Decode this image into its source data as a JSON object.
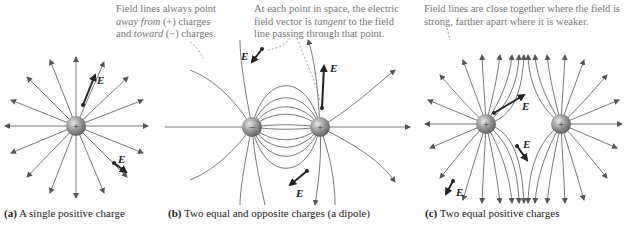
{
  "panels": [
    {
      "id": "a",
      "caption_label": "(a)",
      "caption_text": "A single positive charge",
      "charges": [
        {
          "sign": "+",
          "x": 76,
          "y": 126
        }
      ],
      "vector_labels": [
        "E",
        "E"
      ]
    },
    {
      "id": "b",
      "caption_label": "(b)",
      "caption_text": "Two equal and opposite charges (a dipole)",
      "charges": [
        {
          "sign": "−",
          "x": 252,
          "y": 127
        },
        {
          "sign": "+",
          "x": 320,
          "y": 127
        }
      ],
      "note_left": [
        "Field lines always point",
        "away from (+) charges",
        "and toward (−) charges."
      ],
      "note_right": [
        "At each point in space, the electric",
        "field vector is tangent to the field",
        "line passing through that point."
      ],
      "vector_labels": [
        "E",
        "E",
        "E"
      ]
    },
    {
      "id": "c",
      "caption_label": "(c)",
      "caption_text": "Two equal positive charges",
      "charges": [
        {
          "sign": "+",
          "x": 486,
          "y": 124
        },
        {
          "sign": "+",
          "x": 561,
          "y": 124
        }
      ],
      "note": [
        "Field lines are close together where the field is",
        "strong, farther apart where it is weaker."
      ],
      "vector_labels": [
        "E",
        "E",
        "E"
      ]
    }
  ],
  "colors": {
    "line": "#555555",
    "sphere": "#8a8a8a",
    "note_text": "#777777",
    "caption_text": "#222222"
  }
}
